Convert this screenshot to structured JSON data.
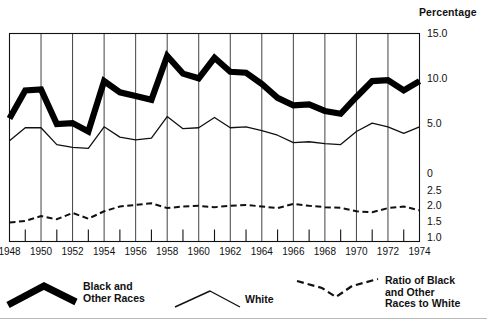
{
  "axis": {
    "percentage_title": "Percentage",
    "y_ticks_percent": [
      "15.0",
      "10.0",
      "5.0",
      "0"
    ],
    "y_ticks_ratio": [
      "2.5",
      "2.0",
      "1.5",
      "1.0"
    ],
    "x_ticks": [
      "1948",
      "1950",
      "1952",
      "1954",
      "1956",
      "1958",
      "1960",
      "1962",
      "1964",
      "1966",
      "1968",
      "1970",
      "1972",
      "1974"
    ]
  },
  "legend": {
    "black_label": "Black and\nOther Races",
    "white_label": "White",
    "ratio_label": "Ratio of Black\nand Other\nRaces to White"
  },
  "colors": {
    "ink": "#111111",
    "series_black": "#000000",
    "background": "#ffffff"
  },
  "chart_data": {
    "type": "line",
    "title": "",
    "subtitle": "",
    "xlabel": "",
    "ylabel": "Percentage",
    "xlim": [
      1948,
      1974
    ],
    "grid": true,
    "grid_every_years": 2,
    "minor_ticks_every_years": 1,
    "legend_position": "below-plot",
    "axes": [
      {
        "name": "percentage",
        "label": "Percentage",
        "ticks": [
          0,
          5.0,
          10.0,
          15.0
        ],
        "ylim": [
          0,
          15.0
        ]
      },
      {
        "name": "ratio",
        "label": "Ratio of Black and Other Races to White",
        "ticks": [
          1.0,
          1.5,
          2.0,
          2.5
        ],
        "ylim": [
          1.0,
          2.5
        ]
      }
    ],
    "x": [
      1948,
      1949,
      1950,
      1951,
      1952,
      1953,
      1954,
      1955,
      1956,
      1957,
      1958,
      1959,
      1960,
      1961,
      1962,
      1963,
      1964,
      1965,
      1966,
      1967,
      1968,
      1969,
      1970,
      1971,
      1972,
      1973,
      1974
    ],
    "series": [
      {
        "name": "Black and Other Races",
        "axis": "percentage",
        "style": "thick-solid",
        "values": [
          5.9,
          8.9,
          9.0,
          5.3,
          5.4,
          4.5,
          9.9,
          8.7,
          8.3,
          7.9,
          12.6,
          10.7,
          10.2,
          12.4,
          10.9,
          10.8,
          9.6,
          8.1,
          7.3,
          7.4,
          6.7,
          6.4,
          8.2,
          9.9,
          10.0,
          8.9,
          9.9
        ]
      },
      {
        "name": "White",
        "axis": "percentage",
        "style": "thin-solid",
        "values": [
          3.5,
          4.9,
          4.9,
          3.1,
          2.8,
          2.7,
          5.0,
          3.9,
          3.6,
          3.8,
          6.1,
          4.8,
          4.9,
          6.0,
          4.9,
          5.0,
          4.6,
          4.1,
          3.3,
          3.4,
          3.2,
          3.1,
          4.5,
          5.4,
          5.0,
          4.3,
          5.0
        ]
      },
      {
        "name": "Ratio of Black and Other Races to White",
        "axis": "ratio",
        "style": "dashed",
        "values": [
          1.5,
          1.55,
          1.7,
          1.6,
          1.8,
          1.62,
          1.85,
          2.0,
          2.05,
          2.1,
          1.95,
          2.0,
          2.02,
          1.98,
          2.02,
          2.05,
          2.0,
          1.95,
          2.08,
          2.02,
          1.98,
          1.96,
          1.85,
          1.82,
          1.95,
          2.0,
          1.88
        ]
      }
    ]
  }
}
